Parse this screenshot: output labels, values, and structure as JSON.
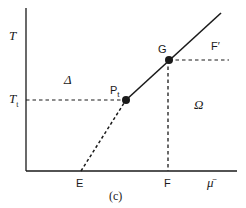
{
  "figure": {
    "caption": "(c)",
    "axes": {
      "y_label": "T",
      "x_label": "μ̄",
      "y_tick": {
        "label": "T",
        "subscript": "t"
      }
    },
    "regions": {
      "left": "Δ",
      "right": "Ω"
    },
    "points": {
      "pt": {
        "label": "P",
        "subscript": "t"
      },
      "g": {
        "label": "G"
      },
      "f_prime": {
        "label": "F′"
      },
      "e": {
        "label": "E"
      },
      "f": {
        "label": "F"
      }
    },
    "colors": {
      "ink": "#1a1a1a",
      "background": "#ffffff"
    }
  }
}
